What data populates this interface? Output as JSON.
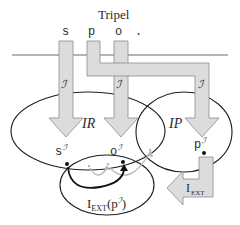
{
  "title": "Tripel",
  "triple": {
    "subject": "s",
    "predicate": "p",
    "object": "o",
    "terminator": "."
  },
  "interpretation_label": "ℐ",
  "sets": {
    "resources": "IR",
    "properties": "IP"
  },
  "interpreted": {
    "subject": "s",
    "object": "o",
    "predicate": "p",
    "superscript": "ℐ"
  },
  "extension": {
    "function_label": "I",
    "function_sub": "EXT",
    "set_label_prefix": "I",
    "set_label_sub": "EXT",
    "set_label_arg": "(p",
    "set_label_sup": "ℐ",
    "set_label_close": ")"
  },
  "colors": {
    "arrow_fill": "#dcdcdc",
    "arrow_stroke": "#8a8a8a",
    "line": "#1e1e1e",
    "faded_arc": "#b8b8b8",
    "text": "#2a2a2a"
  }
}
